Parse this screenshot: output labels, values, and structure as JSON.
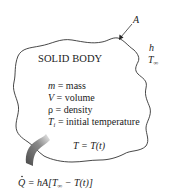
{
  "diagram": {
    "body_label": "SOLID BODY",
    "surface_area_label": "A",
    "ambient": {
      "h": "h",
      "T": "T",
      "T_sub": "∞"
    },
    "properties": [
      {
        "symbol": "m",
        "sub": "",
        "rest": " = mass"
      },
      {
        "symbol": "V",
        "sub": "",
        "rest": " = volume"
      },
      {
        "symbol": "ρ",
        "sub": "",
        "rest": " = density"
      },
      {
        "symbol": "T",
        "sub": "i",
        "rest": " = initial temperature"
      }
    ],
    "temperature_function": "T = T(t)",
    "heat_rate_equation": {
      "lhs": "Q",
      "rhs_prefix": " = hA[T",
      "sub": "∞",
      "rhs_suffix": " − T(t)]"
    },
    "colors": {
      "outline": "#333333",
      "arrow_dark": "#555555",
      "arrow_light": "#dddddd"
    }
  }
}
